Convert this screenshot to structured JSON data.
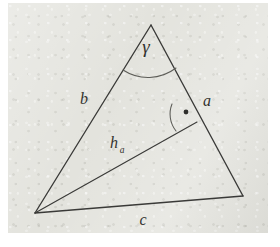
{
  "figure": {
    "kind": "geometry-diagram",
    "background_color": "#e3e3dd",
    "stroke_color": "#3a3a38",
    "text_color": "#33332f",
    "canvas": {
      "width": 280,
      "height": 247
    },
    "paper": {
      "x": 8,
      "y": 3,
      "width": 260,
      "height": 230
    }
  },
  "vertices": {
    "apex": {
      "name": "C",
      "x": 151,
      "y": 25
    },
    "left": {
      "name": "A",
      "x": 35,
      "y": 213
    },
    "right": {
      "name": "B",
      "x": 243,
      "y": 196
    },
    "altitude_foot": {
      "name": "H",
      "x": 197,
      "y": 122
    }
  },
  "sides": [
    {
      "id": "side-a",
      "label": "a",
      "from": "apex",
      "to": "right",
      "label_x": 207,
      "label_y": 106
    },
    {
      "id": "side-b",
      "label": "b",
      "from": "apex",
      "to": "left",
      "label_x": 84,
      "label_y": 104
    },
    {
      "id": "side-c",
      "label": "c",
      "from": "left",
      "to": "right",
      "label_x": 143,
      "label_y": 225
    }
  ],
  "altitude": {
    "id": "altitude-ha",
    "label_base": "h",
    "label_subscript": "a",
    "from": "left",
    "to": "altitude_foot",
    "label_x": 114,
    "label_y": 148
  },
  "angles": [
    {
      "id": "angle-gamma",
      "label": "γ",
      "at_vertex": "apex",
      "label_x": 146,
      "label_y": 53,
      "arc": {
        "start_x": 123,
        "start_y": 70,
        "end_x": 176,
        "end_y": 68,
        "radius": 46
      }
    },
    {
      "id": "angle-right",
      "label": "",
      "marker": "right-angle-dot",
      "at_vertex": "altitude_foot",
      "dot_x": 186,
      "dot_y": 112,
      "dot_radius": 2.4
    }
  ],
  "labels": {
    "side_a": "a",
    "side_b": "b",
    "side_c": "c",
    "altitude_h": "h",
    "altitude_sub": "a",
    "angle_gamma": "γ"
  }
}
